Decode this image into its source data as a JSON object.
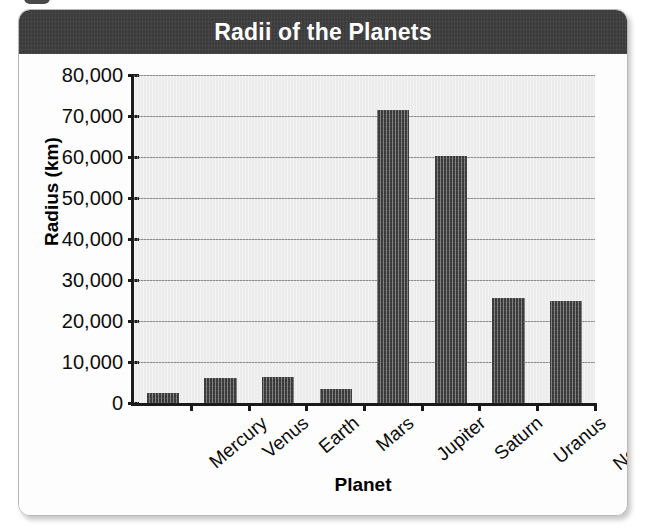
{
  "figure": {
    "title": "Radii of the Planets",
    "ghost_text": "and a time to Radii of the . . ."
  },
  "chart_data": {
    "type": "bar",
    "title": "Radii of the Planets",
    "xlabel": "Planet",
    "ylabel": "Radius (km)",
    "categories": [
      "Mercury",
      "Venus",
      "Earth",
      "Mars",
      "Jupiter",
      "Saturn",
      "Uranus",
      "Neptune"
    ],
    "values": [
      2440,
      6050,
      6380,
      3400,
      71500,
      60300,
      25600,
      24800
    ],
    "ylim": [
      0,
      80000
    ],
    "ytick_values": [
      0,
      10000,
      20000,
      30000,
      40000,
      50000,
      60000,
      70000,
      80000
    ],
    "ytick_labels": [
      "0",
      "10,000",
      "20,000",
      "30,000",
      "40,000",
      "50,000",
      "60,000",
      "70,000",
      "80,000"
    ],
    "grid": true,
    "legend": false,
    "bar_color": "#3a3a3a",
    "plot_background": "#ececec",
    "title_bar_color": "#3c3c3c",
    "title_text_color": "#ffffff"
  }
}
